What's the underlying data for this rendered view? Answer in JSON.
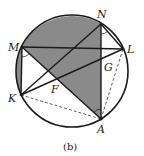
{
  "figure": {
    "caption": "(b)",
    "circle": {
      "cx": 72,
      "cy": 71,
      "r": 56
    },
    "points": {
      "M": {
        "x": 22,
        "y": 47,
        "label": "M",
        "lx": 8,
        "ly": 49
      },
      "N": {
        "x": 101,
        "y": 24,
        "label": "N",
        "lx": 97,
        "ly": 16
      },
      "L": {
        "x": 123,
        "y": 49,
        "label": "L",
        "lx": 128,
        "ly": 52
      },
      "K": {
        "x": 21,
        "y": 95,
        "label": "K",
        "lx": 8,
        "ly": 101
      },
      "A": {
        "x": 101,
        "y": 119,
        "label": "A",
        "lx": 97,
        "ly": 132
      },
      "F": {
        "x": 57,
        "y": 80,
        "label": "F",
        "lx": 51,
        "ly": 93
      },
      "G": {
        "x": 101,
        "y": 60,
        "label": "G",
        "lx": 104,
        "ly": 70
      }
    },
    "labels": [
      "M",
      "N",
      "L",
      "K",
      "A",
      "F",
      "G"
    ],
    "solid_segments": [
      "ML",
      "MA",
      "KN",
      "KL",
      "NL",
      "NA",
      "MK"
    ],
    "dashed_segments": [
      "KA",
      "AL"
    ],
    "shaded_regions": [
      "arc MN + NA + AM",
      "segment between chord MK and arc MK"
    ],
    "colors": {
      "stroke": "#1a1a1a",
      "shade": "#8a8a8a",
      "background": "#ffffff"
    }
  }
}
